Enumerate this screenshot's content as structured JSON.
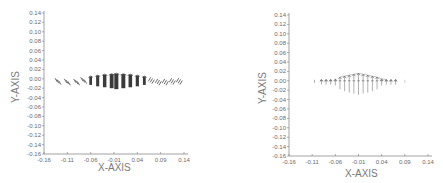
{
  "chart_data": [
    {
      "type": "scatter",
      "subtype": "vector-field (quiver)",
      "title": "",
      "xlabel": "X-AXIS",
      "ylabel": "Y-AXIS",
      "xlim": [
        -0.16,
        0.14
      ],
      "ylim": [
        -0.16,
        0.14
      ],
      "x_ticks": [
        "-0.16",
        "-0.11",
        "-0.06",
        "-0.01",
        "0.04",
        "0.09",
        "0.14"
      ],
      "y_ticks": [
        "0.14",
        "0.12",
        "0.10",
        "0.08",
        "0.06",
        "0.04",
        "0.02",
        "0.00",
        "-0.02",
        "-0.04",
        "-0.06",
        "-0.08",
        "-0.10",
        "-0.12",
        "-0.14",
        "-0.16"
      ],
      "grid": false,
      "legend": null,
      "description": "Dense band of vectors along y≈0 from x≈-0.13 to x≈0.13; dark tall vertical bars near center (x≈-0.06 to 0.06) extending from y≈+0.01 to y≈-0.02, sparse slanted arrows toward edges",
      "series": [
        {
          "name": "vectors",
          "x": [
            -0.13,
            -0.11,
            -0.09,
            -0.075,
            -0.06,
            -0.045,
            -0.03,
            -0.015,
            -0.005,
            0.01,
            0.025,
            0.04,
            0.055,
            0.07,
            0.085,
            0.1,
            0.115,
            0.13
          ],
          "y_top": [
            -0.003,
            -0.002,
            0.0,
            0.003,
            0.005,
            0.007,
            0.009,
            0.01,
            0.011,
            0.01,
            0.009,
            0.007,
            0.005,
            0.003,
            0.0,
            -0.002,
            -0.003,
            -0.004
          ],
          "y_bottom": [
            -0.008,
            -0.012,
            -0.014,
            -0.01,
            -0.013,
            -0.016,
            -0.018,
            -0.02,
            -0.022,
            -0.02,
            -0.018,
            -0.016,
            -0.013,
            -0.01,
            -0.014,
            -0.012,
            -0.008,
            -0.007
          ]
        }
      ]
    },
    {
      "type": "scatter",
      "subtype": "vector-field (quiver)",
      "title": "",
      "xlabel": "X-AXIS",
      "ylabel": "Y-AXIS",
      "xlim": [
        -0.16,
        0.14
      ],
      "ylim": [
        -0.16,
        0.14
      ],
      "x_ticks": [
        "-0.16",
        "-0.11",
        "-0.06",
        "-0.01",
        "0.04",
        "0.09",
        "0.14"
      ],
      "y_ticks": [
        "0.14",
        "0.12",
        "0.10",
        "0.08",
        "0.06",
        "0.04",
        "0.02",
        "0.00",
        "-0.02",
        "-0.04",
        "-0.06",
        "-0.08",
        "-0.10",
        "-0.12",
        "-0.14",
        "-0.16"
      ],
      "grid": false,
      "legend": null,
      "description": "Row of vertical arrows along y≈0 from x≈-0.1 to x≈0.09; central arrows (x≈-0.05 to 0.04) longer, tips forming an arch peaking ~0.015 near x≈-0.01, tails reaching ~-0.03",
      "series": [
        {
          "name": "vectors",
          "x": [
            -0.09,
            -0.08,
            -0.07,
            -0.06,
            -0.05,
            -0.04,
            -0.03,
            -0.02,
            -0.01,
            0.0,
            0.01,
            0.02,
            0.03,
            0.04,
            0.05,
            0.06,
            0.07
          ],
          "y_top": [
            0.003,
            0.003,
            0.003,
            0.004,
            0.008,
            0.01,
            0.012,
            0.014,
            0.016,
            0.014,
            0.012,
            0.01,
            0.008,
            0.004,
            0.003,
            0.003,
            0.003
          ],
          "y_bottom": [
            -0.008,
            -0.008,
            -0.008,
            -0.01,
            -0.018,
            -0.022,
            -0.025,
            -0.027,
            -0.03,
            -0.027,
            -0.025,
            -0.022,
            -0.018,
            -0.01,
            -0.008,
            -0.008,
            -0.008
          ]
        }
      ]
    }
  ],
  "plots": {
    "left": {
      "xlabel": "X-AXIS",
      "ylabel": "Y-AXIS"
    },
    "right": {
      "xlabel": "X-AXIS",
      "ylabel": "Y-AXIS"
    }
  }
}
